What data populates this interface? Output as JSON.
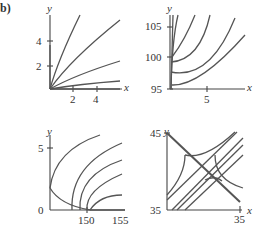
{
  "figure": {
    "label": "b)",
    "panels": [
      {
        "id": "top-left",
        "x_axis_label": "x",
        "y_axis_label": "y",
        "x_ticks": [
          "2",
          "4"
        ],
        "y_ticks": [
          "2",
          "4"
        ]
      },
      {
        "id": "top-right",
        "x_axis_label": "x",
        "y_axis_label": "y",
        "x_ticks": [
          "5"
        ],
        "y_ticks": [
          "95",
          "100",
          "105"
        ]
      },
      {
        "id": "bottom-left",
        "x_axis_label": "x",
        "y_axis_label": "y",
        "x_ticks": [
          "150",
          "155"
        ],
        "y_ticks": [
          "0",
          "5"
        ]
      },
      {
        "id": "bottom-right",
        "x_axis_label": "x",
        "y_axis_label": "y",
        "x_ticks": [
          "35"
        ],
        "y_ticks": [
          "35",
          "45"
        ]
      }
    ],
    "curve_color": "#555555",
    "axis_color": "#444444"
  }
}
